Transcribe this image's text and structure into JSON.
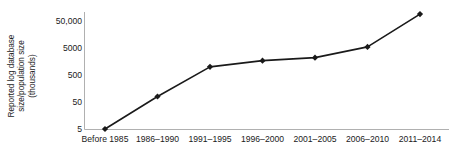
{
  "chart_data": {
    "type": "line",
    "title": "",
    "xlabel": "",
    "ylabel": "Reported  log database size/population size (thousands)",
    "ylabel_lines": [
      "Reported  log database",
      "size/population size",
      "(thousands)"
    ],
    "categories": [
      "Before 1985",
      "1986–1990",
      "1991–1995",
      "1996–2000",
      "2001–2005",
      "2006–2010",
      "2011–2014"
    ],
    "values": [
      5,
      80,
      1000,
      1700,
      2200,
      5500,
      90000
    ],
    "yscale": "log",
    "ylim": [
      5,
      150000
    ],
    "yticks": [
      5,
      50,
      500,
      5000,
      50000
    ],
    "ytick_labels": [
      "5",
      "50",
      "500",
      "5000",
      "50,000"
    ],
    "grid": false,
    "legend": false,
    "series": [
      {
        "name": "Reported log database size/population size",
        "values": [
          5,
          80,
          1000,
          1700,
          2200,
          5500,
          90000
        ]
      }
    ],
    "line_color": "#1a1a1a",
    "marker": "diamond",
    "marker_color": "#1a1a1a",
    "axis_color": "#b0b0b0"
  }
}
